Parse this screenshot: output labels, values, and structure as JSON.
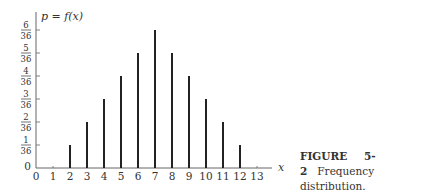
{
  "chart_data": {
    "type": "bar",
    "title": "",
    "ylabel": "p = f(x)",
    "xlabel": "x",
    "x": [
      0,
      1,
      2,
      3,
      4,
      5,
      6,
      7,
      8,
      9,
      10,
      11,
      12,
      13
    ],
    "x_tick_labels": [
      "0",
      "1",
      "2",
      "3",
      "4",
      "5",
      "6",
      "7",
      "8",
      "9",
      "10",
      "11",
      "12",
      "13"
    ],
    "y_tick_labels": [
      "0",
      "1/36",
      "2/36",
      "3/36",
      "4/36",
      "5/36",
      "6/36"
    ],
    "y_ticks_numerators": [
      1,
      2,
      3,
      4,
      5,
      6
    ],
    "y_tick_denominator": "36",
    "categories": [
      2,
      3,
      4,
      5,
      6,
      7,
      8,
      9,
      10,
      11,
      12
    ],
    "values_over_36": [
      1,
      2,
      3,
      4,
      5,
      6,
      5,
      4,
      3,
      2,
      1
    ],
    "values": [
      0.0278,
      0.0556,
      0.0833,
      0.1111,
      0.1389,
      0.1667,
      0.1389,
      0.1111,
      0.0833,
      0.0556,
      0.0278
    ],
    "ylim": [
      0,
      0.1667
    ],
    "xlim": [
      0,
      13.5
    ],
    "grid": false,
    "legend": null,
    "style": "spike/stem lines"
  },
  "caption": {
    "label": "FIGURE",
    "number": "5-2",
    "text": "Frequency distribution."
  },
  "colors": {
    "bars": "#222222",
    "axes": "#666666",
    "text": "#333333"
  }
}
